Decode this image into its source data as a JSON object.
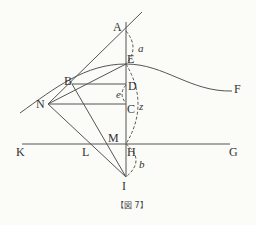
{
  "figure": {
    "caption": "【図 7】",
    "points": {
      "A": "A",
      "B": "B",
      "C": "C",
      "D": "D",
      "E": "E",
      "F": "F",
      "G": "G",
      "H": "H",
      "I": "I",
      "K": "K",
      "L": "L",
      "M": "M",
      "N": "N"
    },
    "arc_labels": {
      "a": "a",
      "b": "b",
      "e": "e",
      "z": "z"
    },
    "colors": {
      "line": "#555555",
      "background": "#fbfbf8"
    }
  }
}
